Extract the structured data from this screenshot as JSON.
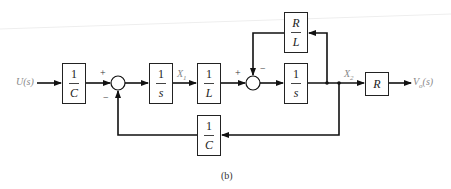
{
  "diagram": {
    "input_label": "U(s)",
    "output_label": "Vo(s)",
    "output_label_main": "V",
    "output_label_sub": "o",
    "output_label_arg": "(s)",
    "caption": "(b)",
    "signals": {
      "x1": {
        "main": "X",
        "sub": "1"
      },
      "x2": {
        "main": "X",
        "sub": "2"
      }
    },
    "blocks": {
      "input_gain": {
        "num": "1",
        "den": "C"
      },
      "integrator_1": {
        "num": "1",
        "den": "s"
      },
      "inductance_gain": {
        "num": "1",
        "den": "L"
      },
      "integrator_2": {
        "num": "1",
        "den": "s"
      },
      "rl_feedback": {
        "num": "R",
        "den": "L"
      },
      "output_gain": {
        "label": "R"
      },
      "c_feedback": {
        "num": "1",
        "den": "C"
      }
    },
    "summing_junctions": {
      "sum1": {
        "plus": "+",
        "minus": "−"
      },
      "sum2": {
        "plus": "+",
        "minus": "−"
      }
    }
  }
}
